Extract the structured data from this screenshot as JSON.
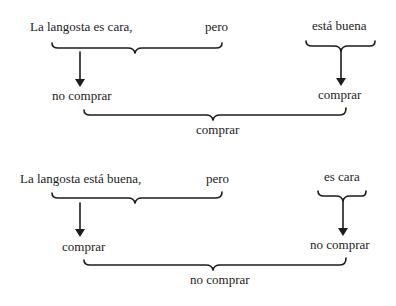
{
  "diagrams": [
    {
      "premise_left": "La langosta es cara,",
      "connector": "pero",
      "premise_right": "está buena",
      "conclusion_left": "no comprar",
      "conclusion_right": "comprar",
      "final_conclusion": "comprar"
    },
    {
      "premise_left": "La langosta está buena,",
      "connector": "pero",
      "premise_right": "es cara",
      "conclusion_left": "comprar",
      "conclusion_right": "no comprar",
      "final_conclusion": "no comprar"
    }
  ]
}
